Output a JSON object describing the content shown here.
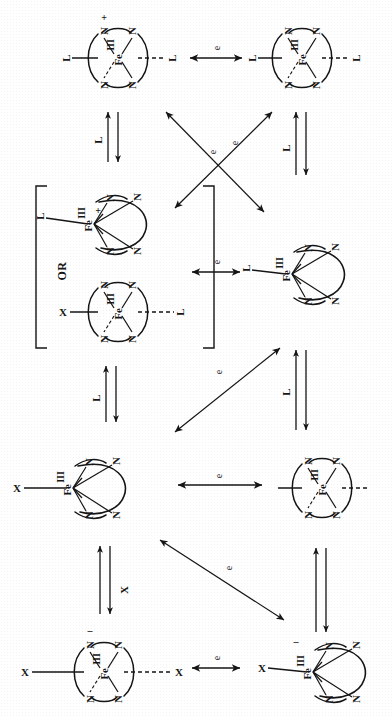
{
  "figure": {
    "type": "reaction-scheme",
    "medium": "scanned monochrome line drawing",
    "grid": {
      "rows": 4,
      "columns": 2
    },
    "palette": {
      "ink": "#151515",
      "paper": "#ffffff"
    }
  },
  "labels": {
    "metal": "Fe",
    "donor": "N",
    "ligand_L": "L",
    "ligand_X": "X",
    "electron": "e",
    "charge_plus": "+",
    "charge_minus": "–",
    "or": "OR",
    "oxidation_state": "III"
  },
  "species": [
    {
      "id": "s1",
      "row": 1,
      "column": "left",
      "geometry": "octahedral",
      "view": "in-plane",
      "metal": "Fe",
      "oxidation_state": "III",
      "charge": "+",
      "axial_ligands": [
        "L",
        "L"
      ],
      "equatorial_donors": [
        "N",
        "N",
        "N",
        "N"
      ],
      "bracketed": false
    },
    {
      "id": "s2",
      "row": 1,
      "column": "right",
      "geometry": "octahedral",
      "view": "in-plane",
      "metal": "Fe",
      "oxidation_state": "II",
      "charge": "",
      "axial_ligands": [
        "L",
        "L"
      ],
      "equatorial_donors": [
        "N",
        "N",
        "N",
        "N"
      ],
      "bracketed": false
    },
    {
      "id": "s3a",
      "row": 2,
      "column": "left",
      "geometry": "square-pyramidal",
      "view": "side",
      "metal": "Fe",
      "oxidation_state": "III",
      "charge": "+",
      "axial_ligands": [
        "L"
      ],
      "equatorial_donors": [
        "N",
        "N",
        "N",
        "N"
      ],
      "bracketed": true
    },
    {
      "id": "s3b",
      "row": 2,
      "column": "left",
      "geometry": "octahedral",
      "view": "in-plane",
      "metal": "Fe",
      "oxidation_state": "III",
      "charge": "",
      "axial_ligands": [
        "X",
        "L"
      ],
      "equatorial_donors": [
        "N",
        "N",
        "N",
        "N"
      ],
      "bracketed": true
    },
    {
      "id": "s4",
      "row": 2,
      "column": "right",
      "geometry": "square-pyramidal",
      "view": "side",
      "metal": "Fe",
      "oxidation_state": "II",
      "charge": "",
      "axial_ligands": [
        "L"
      ],
      "equatorial_donors": [
        "N",
        "N",
        "N",
        "N"
      ],
      "bracketed": false
    },
    {
      "id": "s5",
      "row": 3,
      "column": "left",
      "geometry": "square-pyramidal",
      "view": "side",
      "metal": "Fe",
      "oxidation_state": "III",
      "charge": "",
      "axial_ligands": [
        "X"
      ],
      "equatorial_donors": [
        "N",
        "N",
        "N",
        "N"
      ],
      "bracketed": false
    },
    {
      "id": "s6",
      "row": 3,
      "column": "right",
      "geometry": "octahedral",
      "view": "in-plane",
      "metal": "Fe",
      "oxidation_state": "II",
      "charge": "",
      "axial_ligands": [
        "",
        ""
      ],
      "equatorial_donors": [
        "N",
        "N",
        "N",
        "N"
      ],
      "bracketed": false
    },
    {
      "id": "s7",
      "row": 4,
      "column": "left",
      "geometry": "octahedral",
      "view": "in-plane",
      "metal": "Fe",
      "oxidation_state": "III",
      "charge": "–",
      "axial_ligands": [
        "X",
        "X"
      ],
      "equatorial_donors": [
        "N",
        "N",
        "N",
        "N"
      ],
      "bracketed": false
    },
    {
      "id": "s8",
      "row": 4,
      "column": "right",
      "geometry": "square-pyramidal",
      "view": "side",
      "metal": "Fe",
      "oxidation_state": "II",
      "charge": "–",
      "axial_ligands": [
        "X"
      ],
      "equatorial_donors": [
        "N",
        "N",
        "N",
        "N"
      ],
      "bracketed": false
    }
  ],
  "arrows": [
    {
      "id": "a1",
      "kind": "double-headed",
      "orientation": "horizontal",
      "label": "e",
      "from": "s1",
      "to": "s2"
    },
    {
      "id": "a2",
      "kind": "equilibrium",
      "orientation": "vertical",
      "label": "L",
      "from": "s1",
      "to": "s3a"
    },
    {
      "id": "a3",
      "kind": "equilibrium",
      "orientation": "vertical",
      "label": "L",
      "from": "s2",
      "to": "s4"
    },
    {
      "id": "a4",
      "kind": "double-headed",
      "orientation": "diagonal-up-right",
      "label": "e",
      "from": "s3a",
      "to": "s2"
    },
    {
      "id": "a5",
      "kind": "double-headed",
      "orientation": "diagonal-down-right",
      "label": "e",
      "from": "s1",
      "to": "s4"
    },
    {
      "id": "a6",
      "kind": "double-headed",
      "orientation": "horizontal",
      "label": "e",
      "from": "s3b",
      "to": "s4"
    },
    {
      "id": "a7",
      "kind": "equilibrium",
      "orientation": "vertical",
      "label": "L",
      "from": "s3b",
      "to": "s5"
    },
    {
      "id": "a8",
      "kind": "equilibrium",
      "orientation": "vertical",
      "label": "L",
      "from": "s4",
      "to": "s6"
    },
    {
      "id": "a9",
      "kind": "double-headed",
      "orientation": "diagonal-up-right",
      "label": "e",
      "from": "s5",
      "to": "s4"
    },
    {
      "id": "a10",
      "kind": "double-headed",
      "orientation": "horizontal",
      "label": "e",
      "from": "s5",
      "to": "s6"
    },
    {
      "id": "a11",
      "kind": "equilibrium",
      "orientation": "vertical",
      "label": "X",
      "from": "s5",
      "to": "s7"
    },
    {
      "id": "a12",
      "kind": "equilibrium",
      "orientation": "vertical",
      "label": "",
      "from": "s6",
      "to": "s8"
    },
    {
      "id": "a13",
      "kind": "double-headed",
      "orientation": "diagonal-down-right",
      "label": "e",
      "from": "s5",
      "to": "s8"
    },
    {
      "id": "a14",
      "kind": "double-headed",
      "orientation": "horizontal",
      "label": "e",
      "from": "s7",
      "to": "s8"
    }
  ]
}
